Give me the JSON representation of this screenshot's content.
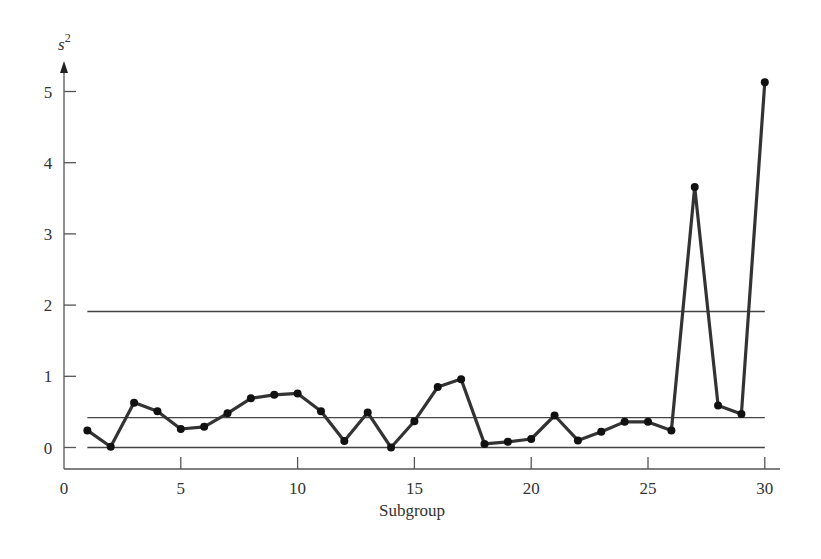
{
  "chart_data": {
    "type": "line",
    "title": "",
    "xlabel": "Subgroup",
    "ylabel": "s²",
    "xlim": [
      0,
      30
    ],
    "ylim": [
      0,
      5.3
    ],
    "x_ticks": [
      0,
      5,
      10,
      15,
      20,
      25,
      30
    ],
    "y_ticks": [
      0,
      1,
      2,
      3,
      4,
      5
    ],
    "grid": false,
    "legend": null,
    "x": [
      1,
      2,
      3,
      4,
      5,
      6,
      7,
      8,
      9,
      10,
      11,
      12,
      13,
      14,
      15,
      16,
      17,
      18,
      19,
      20,
      21,
      22,
      23,
      24,
      25,
      26,
      27,
      28,
      29,
      30
    ],
    "series": [
      {
        "name": "s²",
        "color": "#333333",
        "values": [
          0.24,
          0.01,
          0.63,
          0.51,
          0.26,
          0.29,
          0.48,
          0.69,
          0.74,
          0.76,
          0.51,
          0.09,
          0.49,
          0.0,
          0.37,
          0.85,
          0.96,
          0.05,
          0.08,
          0.12,
          0.45,
          0.1,
          0.22,
          0.36,
          0.36,
          0.24,
          3.66,
          0.59,
          0.47,
          5.13
        ]
      }
    ],
    "reference_lines": [
      {
        "name": "UCL",
        "y": 1.91,
        "x_from": 1,
        "x_to": 30
      },
      {
        "name": "center line",
        "y": 0.42,
        "x_from": 1,
        "x_to": 30
      },
      {
        "name": "LCL",
        "y": 0.0,
        "x_from": 1,
        "x_to": 30
      }
    ]
  },
  "labels": {
    "ylabel_base": "s",
    "ylabel_sup": "2",
    "xlabel": "Subgroup"
  }
}
